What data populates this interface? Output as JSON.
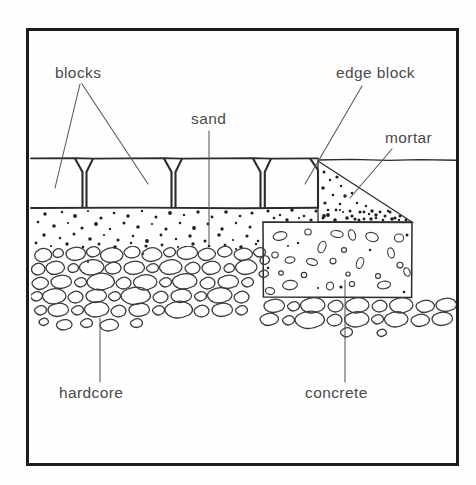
{
  "diagram": {
    "colors": {
      "background": "#fefefe",
      "border": "#1c1c1c",
      "ink": "#2b2b2b",
      "label_text": "#4a4a4a",
      "leader": "#555555",
      "stipple": "#1f1f1f",
      "stone_outline": "#3a3a3a"
    },
    "frame": {
      "x": 26,
      "y": 28,
      "width": 432,
      "height": 437,
      "stroke_width": 3
    },
    "labels": [
      {
        "key": "blocks",
        "text": "blocks",
        "x": 55,
        "y": 78,
        "anchor": "start"
      },
      {
        "key": "edge_block",
        "text": "edge block",
        "x": 336,
        "y": 78,
        "anchor": "start"
      },
      {
        "key": "sand",
        "text": "sand",
        "x": 191,
        "y": 124,
        "anchor": "start"
      },
      {
        "key": "mortar",
        "text": "mortar",
        "x": 385,
        "y": 143,
        "anchor": "start"
      },
      {
        "key": "hardcore",
        "text": "hardcore",
        "x": 59,
        "y": 398,
        "anchor": "start"
      },
      {
        "key": "concrete",
        "text": "concrete",
        "x": 305,
        "y": 398,
        "anchor": "start"
      }
    ],
    "layers": [
      {
        "key": "blocks",
        "name": "paving blocks",
        "top": 158,
        "bottom": 208
      },
      {
        "key": "sand",
        "name": "sand bedding",
        "top": 208,
        "bottom": 248
      },
      {
        "key": "hardcore",
        "name": "hardcore base",
        "top": 248,
        "bottom": 338
      },
      {
        "key": "concrete",
        "name": "concrete haunch",
        "top": 222,
        "bottom": 298
      },
      {
        "key": "mortar",
        "name": "mortar bed",
        "top": 160,
        "bottom": 222
      }
    ],
    "block_count": 4,
    "ground_line_y": 160
  }
}
